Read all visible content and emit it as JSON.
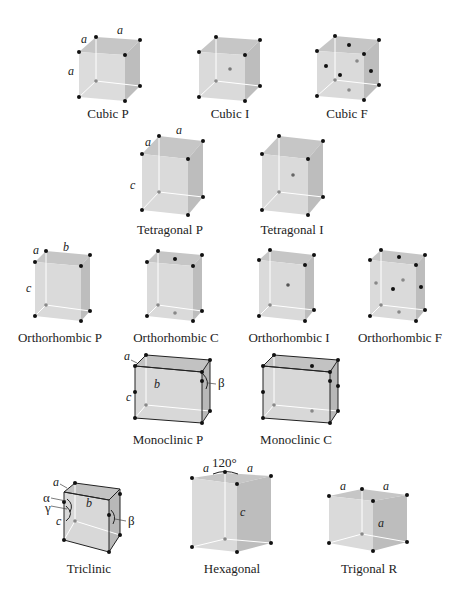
{
  "colors": {
    "face_front": "#dcdcdc",
    "face_top": "#c4c4c4",
    "face_side": "#bdbdbd",
    "point_corner": "#111111",
    "point_inner": "#888888",
    "edge_hidden": "#ffffff",
    "edge_dark": "#222222"
  },
  "lattices": [
    {
      "id": "cubic-p",
      "caption": "Cubic P",
      "labels": [
        "a",
        "a",
        "a"
      ]
    },
    {
      "id": "cubic-i",
      "caption": "Cubic I"
    },
    {
      "id": "cubic-f",
      "caption": "Cubic F"
    },
    {
      "id": "tetragonal-p",
      "caption": "Tetragonal P",
      "labels": [
        "a",
        "a",
        "c"
      ]
    },
    {
      "id": "tetragonal-i",
      "caption": "Tetragonal I"
    },
    {
      "id": "orthorhombic-p",
      "caption": "Orthorhombic P",
      "labels": [
        "a",
        "b",
        "c"
      ]
    },
    {
      "id": "orthorhombic-c",
      "caption": "Orthorhombic C"
    },
    {
      "id": "orthorhombic-i",
      "caption": "Orthorhombic I"
    },
    {
      "id": "orthorhombic-f",
      "caption": "Orthorhombic F"
    },
    {
      "id": "monoclinic-p",
      "caption": "Monoclinic P",
      "labels": [
        "a",
        "b",
        "c"
      ],
      "angles": [
        "β"
      ]
    },
    {
      "id": "monoclinic-c",
      "caption": "Monoclinic C"
    },
    {
      "id": "triclinic",
      "caption": "Triclinic",
      "labels": [
        "a",
        "b",
        "c"
      ],
      "angles": [
        "α",
        "γ",
        "β"
      ]
    },
    {
      "id": "hexagonal",
      "caption": "Hexagonal",
      "labels": [
        "a",
        "a",
        "c"
      ],
      "angle_value": "120°"
    },
    {
      "id": "trigonal-r",
      "caption": "Trigonal R",
      "labels": [
        "a",
        "a",
        "a"
      ]
    }
  ]
}
